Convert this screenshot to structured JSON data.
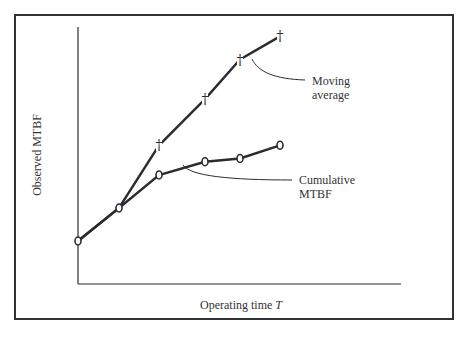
{
  "chart_data": {
    "type": "line",
    "title": "",
    "xlabel": "Operating time T",
    "xlabel_text": "Operating time",
    "xlabel_var": "T",
    "ylabel": "Observed MTBF",
    "grid": false,
    "legend": "annotations",
    "x": [
      0,
      1,
      2,
      3,
      4,
      5
    ],
    "series": [
      {
        "name": "Moving average",
        "marker": "dagger",
        "x": [
          0,
          1,
          2,
          3,
          4,
          5
        ],
        "values": [
          1.0,
          2.0,
          3.9,
          5.3,
          6.5,
          7.2
        ],
        "note": "first two points coincide with cumulative MTBF"
      },
      {
        "name": "Cumulative MTBF",
        "marker": "o",
        "x": [
          0,
          1,
          2,
          3,
          4,
          5
        ],
        "values": [
          1.0,
          2.0,
          3.0,
          3.4,
          3.5,
          3.9
        ]
      }
    ],
    "annotations": [
      {
        "text": [
          "Moving",
          "average"
        ],
        "points_to": "Moving average"
      },
      {
        "text": [
          "Cumulative",
          "MTBF"
        ],
        "points_to": "Cumulative MTBF"
      }
    ],
    "ticks": "none"
  },
  "labels": {
    "ylabel": "Observed MTBF",
    "xlabel": "Operating time",
    "xlabel_var": "T",
    "moving_1": "Moving",
    "moving_2": "average",
    "cum_1": "Cumulative",
    "cum_2": "MTBF"
  },
  "colors": {
    "stroke": "#2a2c30",
    "frame": "#2e3136",
    "text": "#333333"
  }
}
